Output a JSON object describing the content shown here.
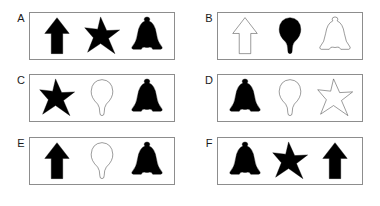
{
  "figure": {
    "title": "",
    "background_color": "#ffffff",
    "border_color": "#8d8d8d",
    "shape_fill_color": "#000000",
    "shape_outline_color": "#3a3a3a",
    "label_color": "#1a1a1a",
    "shape_names": [
      "arrow",
      "star",
      "bell",
      "bulb"
    ],
    "fill_states": [
      "filled",
      "outline"
    ]
  },
  "panels": [
    {
      "label": "A",
      "shapes": [
        {
          "shape": "arrow",
          "fill": "filled"
        },
        {
          "shape": "star",
          "fill": "filled"
        },
        {
          "shape": "bell",
          "fill": "filled"
        }
      ]
    },
    {
      "label": "B",
      "shapes": [
        {
          "shape": "arrow",
          "fill": "outline"
        },
        {
          "shape": "bulb",
          "fill": "filled"
        },
        {
          "shape": "bell",
          "fill": "outline"
        }
      ]
    },
    {
      "label": "C",
      "shapes": [
        {
          "shape": "star",
          "fill": "filled"
        },
        {
          "shape": "bulb",
          "fill": "outline"
        },
        {
          "shape": "bell",
          "fill": "filled"
        }
      ]
    },
    {
      "label": "D",
      "shapes": [
        {
          "shape": "bell",
          "fill": "filled"
        },
        {
          "shape": "bulb",
          "fill": "outline"
        },
        {
          "shape": "star",
          "fill": "outline"
        }
      ]
    },
    {
      "label": "E",
      "shapes": [
        {
          "shape": "arrow",
          "fill": "filled"
        },
        {
          "shape": "bulb",
          "fill": "outline"
        },
        {
          "shape": "bell",
          "fill": "filled"
        }
      ]
    },
    {
      "label": "F",
      "shapes": [
        {
          "shape": "bell",
          "fill": "filled"
        },
        {
          "shape": "star",
          "fill": "filled"
        },
        {
          "shape": "arrow",
          "fill": "filled"
        }
      ]
    }
  ]
}
